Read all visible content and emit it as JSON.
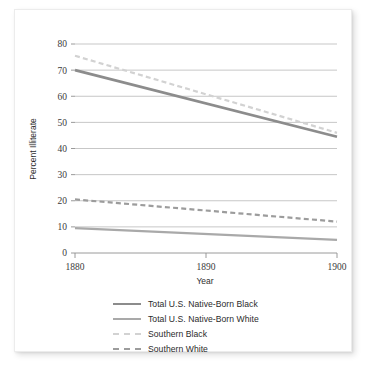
{
  "chart_data": {
    "type": "line",
    "title": "",
    "xlabel": "Year",
    "ylabel": "Percent Illiterate",
    "x": [
      1880,
      1890,
      1900
    ],
    "xlim": [
      1880,
      1900
    ],
    "ylim": [
      0,
      80
    ],
    "xticks": [
      "1880",
      "1890",
      "1900"
    ],
    "yticks": [
      "0",
      "10",
      "20",
      "30",
      "40",
      "50",
      "60",
      "70",
      "80"
    ],
    "grid": "horizontal",
    "legend_position": "below",
    "series": [
      {
        "name": "Total U.S. Native-Born Black",
        "style": "solid",
        "color": "#8c8c8c",
        "width": 2.6,
        "x": [
          1880,
          1900
        ],
        "values": [
          70.0,
          44.5
        ]
      },
      {
        "name": "Total U.S. Native-Born White",
        "style": "solid",
        "color": "#a9a9a9",
        "width": 2.2,
        "x": [
          1880,
          1900
        ],
        "values": [
          9.5,
          5.0
        ]
      },
      {
        "name": "Southern Black",
        "style": "dashed",
        "color": "#d2d2d2",
        "width": 2.2,
        "x": [
          1880,
          1900
        ],
        "values": [
          75.5,
          46.0
        ]
      },
      {
        "name": "Southern White",
        "style": "dashed",
        "color": "#9c9c9c",
        "width": 2.2,
        "x": [
          1880,
          1900
        ],
        "values": [
          20.5,
          12.0
        ]
      }
    ]
  },
  "axes": {
    "y_title": "Percent Illiterate",
    "x_title": "Year",
    "y_ticks": [
      "80",
      "70",
      "60",
      "50",
      "40",
      "30",
      "20",
      "10",
      "0"
    ],
    "x_ticks": [
      "1880",
      "1890",
      "1900"
    ]
  },
  "legend": {
    "items": [
      {
        "label": "Total U.S. Native-Born Black",
        "color": "#8c8c8c",
        "style": "solid",
        "width": 2.6
      },
      {
        "label": "Total U.S. Native-Born White",
        "color": "#a9a9a9",
        "style": "solid",
        "width": 2.2
      },
      {
        "label": "Southern Black",
        "color": "#d2d2d2",
        "style": "dashed",
        "width": 2.2
      },
      {
        "label": "Southern White",
        "color": "#9c9c9c",
        "style": "dashed",
        "width": 2.2
      }
    ]
  }
}
